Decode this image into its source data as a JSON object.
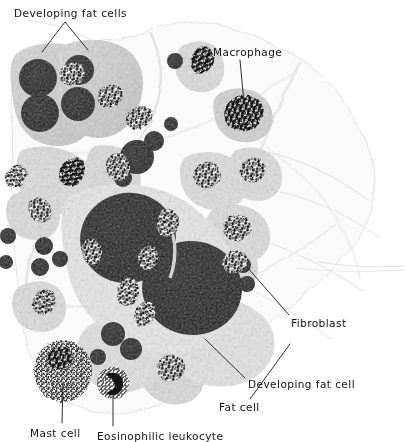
{
  "figure": {
    "kind": "light-micrograph",
    "staining": "grayscale histological section",
    "background_color": "#ffffff",
    "ink_color": "#121212",
    "width": 408,
    "height": 442
  },
  "labels": [
    {
      "id": "developing-fat-cells",
      "text": "Developing fat cells",
      "x": 14,
      "y": 8,
      "leader": "forked",
      "apex": [
        65,
        22
      ],
      "branches": [
        [
          42,
          52
        ],
        [
          88,
          50
        ]
      ]
    },
    {
      "id": "macrophage",
      "text": "Macrophage",
      "x": 213,
      "y": 47,
      "leader": "single",
      "from": [
        240,
        60
      ],
      "to": [
        244,
        103
      ]
    },
    {
      "id": "fibroblast",
      "text": "Fibroblast",
      "x": 291,
      "y": 318,
      "leader": "single",
      "from": [
        289,
        316
      ],
      "to": [
        246,
        268
      ]
    },
    {
      "id": "developing-fat-cell",
      "text": "Developing fat cell",
      "x": 248,
      "y": 379,
      "leader": "single",
      "from": [
        246,
        379
      ],
      "to": [
        205,
        340
      ]
    },
    {
      "id": "fat-cell",
      "text": "Fat cell",
      "x": 219,
      "y": 402,
      "leader": "single",
      "from": [
        248,
        400
      ],
      "to": [
        289,
        345
      ]
    },
    {
      "id": "mast-cell",
      "text": "Mast cell",
      "x": 30,
      "y": 428,
      "leader": "single",
      "from": [
        62,
        424
      ],
      "to": [
        63,
        384
      ]
    },
    {
      "id": "eosinophilic-leukocyte",
      "text": "Eosinophilic leukocyte",
      "x": 97,
      "y": 431,
      "leader": "single",
      "from": [
        113,
        427
      ],
      "to": [
        113,
        396
      ]
    }
  ],
  "structures": {
    "fat_cells": [
      {
        "name": "large-fat-cell-upper",
        "cx": 128,
        "cy": 238,
        "rx": 48,
        "ry": 45
      },
      {
        "name": "large-fat-cell-lower",
        "cx": 192,
        "cy": 288,
        "rx": 50,
        "ry": 47
      }
    ],
    "lipid_droplets": [
      {
        "cx": 38,
        "cy": 78,
        "r": 19
      },
      {
        "cx": 40,
        "cy": 113,
        "r": 19
      },
      {
        "cx": 79,
        "cy": 70,
        "r": 15
      },
      {
        "cx": 78,
        "cy": 104,
        "r": 17
      },
      {
        "cx": 137,
        "cy": 157,
        "r": 17
      },
      {
        "cx": 154,
        "cy": 141,
        "r": 10
      },
      {
        "cx": 123,
        "cy": 178,
        "r": 9
      },
      {
        "cx": 44,
        "cy": 246,
        "r": 9
      },
      {
        "cx": 40,
        "cy": 267,
        "r": 9
      },
      {
        "cx": 60,
        "cy": 259,
        "r": 8
      },
      {
        "cx": 113,
        "cy": 334,
        "r": 12
      },
      {
        "cx": 131,
        "cy": 349,
        "r": 11
      },
      {
        "cx": 98,
        "cy": 357,
        "r": 8
      },
      {
        "cx": 243,
        "cy": 265,
        "r": 8
      },
      {
        "cx": 247,
        "cy": 284,
        "r": 8
      },
      {
        "cx": 175,
        "cy": 61,
        "r": 8
      }
    ],
    "fibroblast_nuclei": [
      {
        "cx": 72,
        "cy": 74,
        "rx": 13,
        "ry": 11
      },
      {
        "cx": 110,
        "cy": 96,
        "rx": 13,
        "ry": 11
      },
      {
        "cx": 72,
        "cy": 172,
        "rx": 12,
        "ry": 15
      },
      {
        "cx": 118,
        "cy": 167,
        "rx": 12,
        "ry": 14
      },
      {
        "cx": 139,
        "cy": 118,
        "rx": 14,
        "ry": 11
      },
      {
        "cx": 202,
        "cy": 60,
        "rx": 11,
        "ry": 14
      },
      {
        "cx": 232,
        "cy": 117,
        "rx": 13,
        "ry": 12
      },
      {
        "cx": 207,
        "cy": 175,
        "rx": 14,
        "ry": 13
      },
      {
        "cx": 253,
        "cy": 170,
        "rx": 13,
        "ry": 12
      },
      {
        "cx": 237,
        "cy": 228,
        "rx": 14,
        "ry": 13
      },
      {
        "cx": 168,
        "cy": 223,
        "rx": 11,
        "ry": 14
      },
      {
        "cx": 235,
        "cy": 262,
        "rx": 13,
        "ry": 11
      },
      {
        "cx": 128,
        "cy": 292,
        "rx": 11,
        "ry": 14
      },
      {
        "cx": 171,
        "cy": 368,
        "rx": 14,
        "ry": 13
      },
      {
        "cx": 145,
        "cy": 314,
        "rx": 10,
        "ry": 13
      },
      {
        "cx": 44,
        "cy": 302,
        "rx": 11,
        "ry": 13
      },
      {
        "cx": 40,
        "cy": 210,
        "rx": 11,
        "ry": 13
      },
      {
        "cx": 148,
        "cy": 258,
        "rx": 10,
        "ry": 12
      }
    ],
    "macrophage": {
      "cx": 244,
      "cy": 113,
      "rx": 20,
      "ry": 18
    },
    "mast_cell": {
      "cx": 63,
      "cy": 371,
      "rx": 28,
      "ry": 30
    },
    "eosinophil": {
      "cx": 113,
      "cy": 383,
      "rx": 15,
      "ry": 15
    }
  }
}
